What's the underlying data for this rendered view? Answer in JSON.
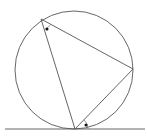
{
  "diagram": {
    "canvas": {
      "width": 147,
      "height": 139
    },
    "colors": {
      "line": "#555555",
      "arc": "#777777",
      "dot": "#111111",
      "background": "#ffffff"
    },
    "circle": {
      "cx": 74,
      "cy": 70,
      "r": 59
    },
    "points": {
      "A": {
        "x": 41,
        "y": 19,
        "role": "inscribed vertex (upper-left)"
      },
      "B": {
        "x": 133,
        "y": 69,
        "role": "inscribed vertex (right)"
      },
      "C": {
        "x": 75,
        "y": 129,
        "role": "point of tangency (bottom)"
      }
    },
    "tangent_line": {
      "x1": 5,
      "y1": 129,
      "x2": 145,
      "y2": 129
    },
    "segments": [
      {
        "from": "A",
        "to": "B"
      },
      {
        "from": "A",
        "to": "C"
      },
      {
        "from": "C",
        "to": "B"
      }
    ],
    "angle_marks": [
      {
        "vertex": "A",
        "between": [
          "AC",
          "AB"
        ],
        "marker": "dot",
        "arc_radius": 11,
        "dot": {
          "x": 47,
          "y": 29
        }
      },
      {
        "vertex": "C",
        "between": [
          "tangent (right)",
          "CB"
        ],
        "marker": "dot",
        "arc_radius": 13,
        "dot": {
          "x": 86,
          "y": 125
        }
      }
    ]
  }
}
